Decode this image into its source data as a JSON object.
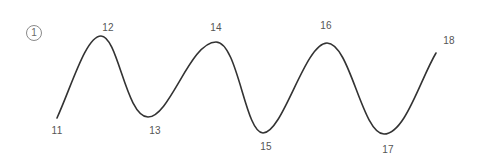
{
  "figure": {
    "number": "1",
    "stroke_color": "#333333",
    "label_color": "#555555"
  },
  "points": [
    {
      "label": "11",
      "x": 57,
      "y": 118,
      "label_x": 57,
      "label_y": 126
    },
    {
      "label": "12",
      "x": 101,
      "y": 36,
      "label_x": 108,
      "label_y": 23
    },
    {
      "label": "13",
      "x": 148,
      "y": 117,
      "label_x": 155,
      "label_y": 126
    },
    {
      "label": "14",
      "x": 216,
      "y": 42,
      "label_x": 216,
      "label_y": 23
    },
    {
      "label": "15",
      "x": 263,
      "y": 133,
      "label_x": 266,
      "label_y": 142
    },
    {
      "label": "16",
      "x": 327,
      "y": 43,
      "label_x": 326,
      "label_y": 21
    },
    {
      "label": "17",
      "x": 384,
      "y": 134,
      "label_x": 388,
      "label_y": 145
    },
    {
      "label": "18",
      "x": 436,
      "y": 53,
      "label_x": 449,
      "label_y": 36
    }
  ]
}
